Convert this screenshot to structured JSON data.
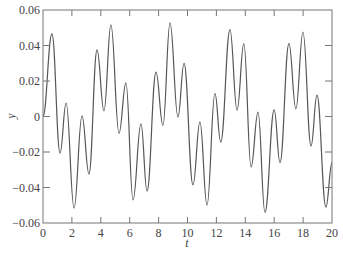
{
  "chart_data": {
    "type": "line",
    "title": "",
    "xlabel": "t",
    "ylabel": "y",
    "xlim": [
      0,
      20
    ],
    "ylim": [
      -0.06,
      0.06
    ],
    "grid": false,
    "legend": null,
    "x_ticks": [
      0,
      2,
      4,
      6,
      8,
      10,
      12,
      14,
      16,
      18,
      20
    ],
    "x_tick_labels": [
      "0",
      "2",
      "4",
      "6",
      "8",
      "10",
      "12",
      "14",
      "16",
      "18",
      "20"
    ],
    "y_ticks": [
      -0.06,
      -0.04,
      -0.02,
      0,
      0.02,
      0.04,
      0.06
    ],
    "y_tick_labels": [
      "−0.06",
      "−0.04",
      "−0.02",
      "0",
      "0.02",
      "0.04",
      "0.06"
    ],
    "line_color": "#555555",
    "series": [
      {
        "name": "y(t)",
        "x": [
          0,
          0.62,
          1.18,
          1.6,
          2.15,
          2.7,
          3.18,
          3.74,
          4.22,
          4.7,
          5.26,
          5.74,
          6.23,
          6.78,
          7.2,
          7.82,
          8.3,
          8.79,
          9.34,
          9.76,
          10.38,
          10.86,
          11.35,
          11.9,
          12.3,
          12.94,
          13.43,
          13.9,
          14.4,
          14.88,
          15.36,
          16.0,
          16.4,
          17.02,
          17.5,
          17.99,
          18.55,
          18.96,
          19.58,
          20.0
        ],
        "values": [
          0.0,
          0.0465,
          -0.0206,
          0.0076,
          -0.0516,
          0.0003,
          -0.0324,
          0.0375,
          0.0031,
          0.0516,
          -0.0095,
          0.019,
          -0.047,
          -0.0042,
          -0.042,
          0.025,
          -0.005,
          0.0527,
          -0.0003,
          0.03,
          -0.0386,
          -0.003,
          -0.05,
          0.013,
          -0.0144,
          0.049,
          0.0035,
          0.041,
          -0.0285,
          0.0025,
          -0.054,
          0.0037,
          -0.026,
          0.041,
          0.0043,
          0.0476,
          -0.0166,
          0.012,
          -0.051,
          -0.026
        ]
      }
    ]
  }
}
